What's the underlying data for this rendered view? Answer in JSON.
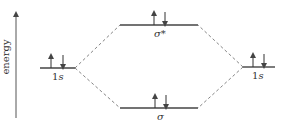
{
  "axis": {
    "label": "energy"
  },
  "levels": {
    "left_1s": {
      "label_num": "1",
      "label_letter": "s",
      "electrons": [
        "up",
        "down"
      ]
    },
    "sigma_star": {
      "label": "σ*",
      "electrons": [
        "up",
        "down"
      ]
    },
    "sigma": {
      "label": "σ",
      "electrons": [
        "up",
        "down"
      ]
    },
    "right_1s": {
      "label_num": "1",
      "label_letter": "s",
      "electrons": [
        "up",
        "down"
      ]
    }
  },
  "colors": {
    "line": "#444444",
    "dashed": "#555555",
    "text": "#333333"
  }
}
